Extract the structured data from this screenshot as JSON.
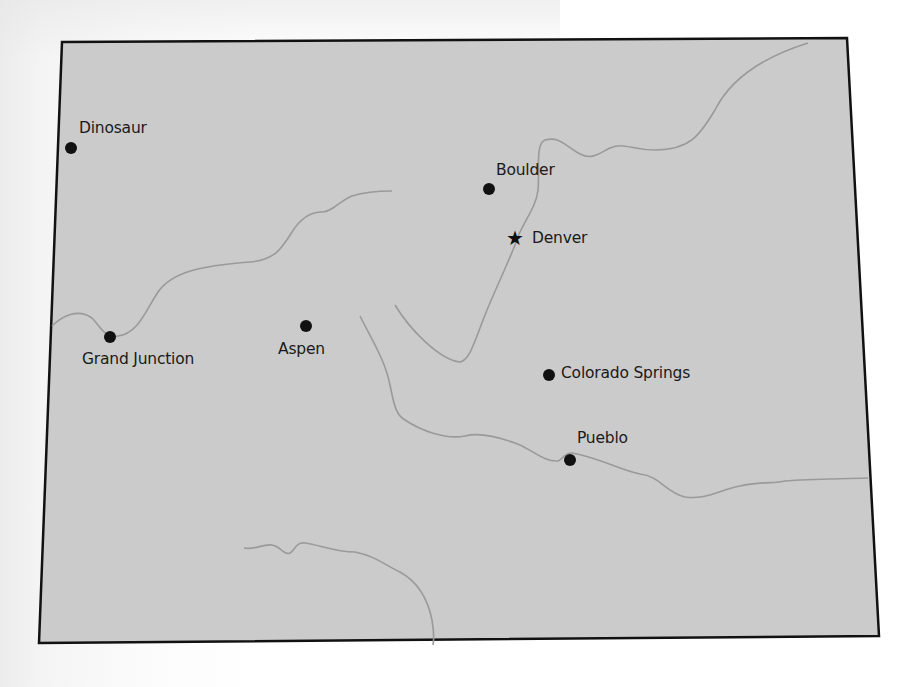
{
  "map": {
    "region": "Colorado",
    "colors": {
      "fill": "#cbcbcb",
      "border": "#111111",
      "river": "#9a9a9a",
      "marker": "#111111",
      "label": "#1a1a1a"
    },
    "capital": {
      "name": "Denver",
      "icon": "star-icon"
    },
    "cities": [
      {
        "name": "Dinosaur",
        "icon": "city-dot-icon"
      },
      {
        "name": "Boulder",
        "icon": "city-dot-icon"
      },
      {
        "name": "Grand Junction",
        "icon": "city-dot-icon"
      },
      {
        "name": "Aspen",
        "icon": "city-dot-icon"
      },
      {
        "name": "Colorado Springs",
        "icon": "city-dot-icon"
      },
      {
        "name": "Pueblo",
        "icon": "city-dot-icon"
      }
    ],
    "star_glyph": "★"
  }
}
